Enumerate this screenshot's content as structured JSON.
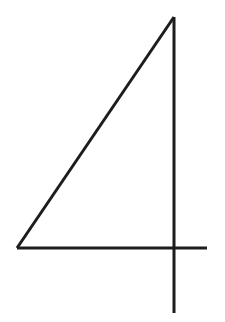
{
  "image": {
    "kind": "handwritten-digit-drawing",
    "label": "4",
    "width": 225,
    "height": 322,
    "background_color": "#ffffff",
    "ink_color": "#1d1d1d",
    "stroke_width": 3,
    "stroke_linecap": "butt"
  },
  "strokes": [
    {
      "name": "diagonal-stroke",
      "description": "diagonal rising from bottom-left vertex to top apex",
      "x1": 17,
      "y1": 248,
      "x2": 174,
      "y2": 17
    },
    {
      "name": "horizontal-stroke",
      "description": "horizontal crossbar from bottom-left vertex to the right",
      "x1": 17,
      "y1": 248,
      "x2": 207,
      "y2": 248
    },
    {
      "name": "vertical-stroke",
      "description": "vertical stem from apex down past the crossbar",
      "x1": 174,
      "y1": 17,
      "x2": 174,
      "y2": 313
    }
  ],
  "points_of_interest": [
    {
      "name": "apex-vertex",
      "x": 174,
      "y": 17
    },
    {
      "name": "bottom-left-vertex",
      "x": 17,
      "y": 248
    },
    {
      "name": "crossbar-right-end",
      "x": 207,
      "y": 248
    },
    {
      "name": "stem-bottom-end",
      "x": 174,
      "y": 313
    },
    {
      "name": "crossing-point",
      "x": 174,
      "y": 248
    }
  ]
}
